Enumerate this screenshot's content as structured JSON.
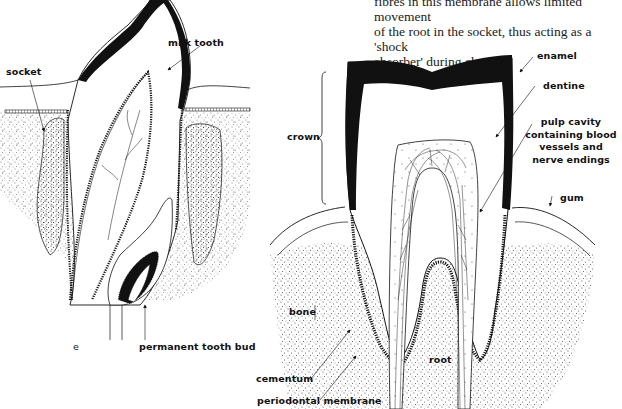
{
  "caption_fragment": {
    "lines": [
      "fibres in this membrane allows limited movement",
      "of the root in the socket, thus acting as a 'shock",
      "absorber' during chewing"
    ]
  },
  "left_figure": {
    "subject": "milk tooth with developing permanent tooth bud",
    "labels": {
      "milk_tooth": "milk tooth",
      "socket": "socket",
      "permanent_tooth_bud": "permanent tooth bud",
      "panel_letter": "e"
    }
  },
  "right_figure": {
    "subject": "vertical section through a molar tooth",
    "labels": {
      "enamel": "enamel",
      "dentine": "dentine",
      "pulp_cavity": [
        "pulp cavity",
        "containing blood",
        "vessels and",
        "nerve endings"
      ],
      "crown": "crown",
      "gum": "gum",
      "bone": "bone",
      "root": "root",
      "cementum": "cementum",
      "periodontal_membrane": "periodontal membrane"
    }
  },
  "colors": {
    "ink": "#111111",
    "paper": "#ffffff",
    "stipple": "#555555"
  }
}
